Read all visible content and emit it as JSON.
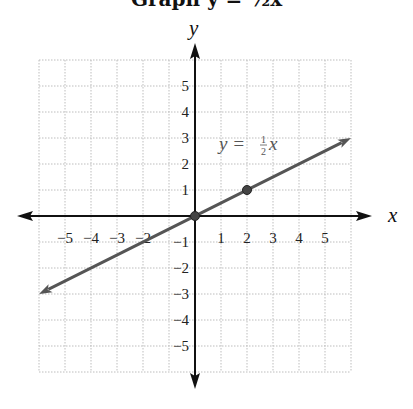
{
  "title": "Graph y = ½x",
  "chart_data": {
    "type": "line",
    "title": "Graph y = ½x",
    "xlabel": "x",
    "ylabel": "y",
    "xlim": [
      -6,
      6
    ],
    "ylim": [
      -6,
      6
    ],
    "grid": true,
    "x_ticks": [
      -5,
      -4,
      -3,
      -2,
      1,
      2,
      3,
      4,
      5
    ],
    "y_ticks": [
      5,
      4,
      3,
      2,
      1,
      -1,
      -2,
      -3,
      -4,
      -5
    ],
    "x_tick_labels": [
      "−5",
      "−4",
      "−3",
      "−2",
      "1",
      "2",
      "3",
      "4",
      "5"
    ],
    "y_tick_labels": [
      "5",
      "4",
      "3",
      "2",
      "1",
      "−1",
      "−2",
      "−3",
      "−4",
      "−5"
    ],
    "series": [
      {
        "name": "y = ½x",
        "equation": "y = (1/2)x",
        "slope": 0.5,
        "intercept": 0,
        "x": [
          -6,
          6
        ],
        "y": [
          -3,
          3
        ],
        "arrows_both_ends": true,
        "color": "#555555"
      }
    ],
    "points": [
      {
        "x": 0,
        "y": 0
      },
      {
        "x": 2,
        "y": 1
      }
    ],
    "annotations": [
      {
        "text": "y = ½x",
        "x": 1,
        "y": 2.7
      }
    ]
  },
  "labels": {
    "x_axis": "x",
    "y_axis": "y",
    "equation_lhs": "y =",
    "equation_num": "1",
    "equation_den": "2",
    "equation_var": "x"
  }
}
